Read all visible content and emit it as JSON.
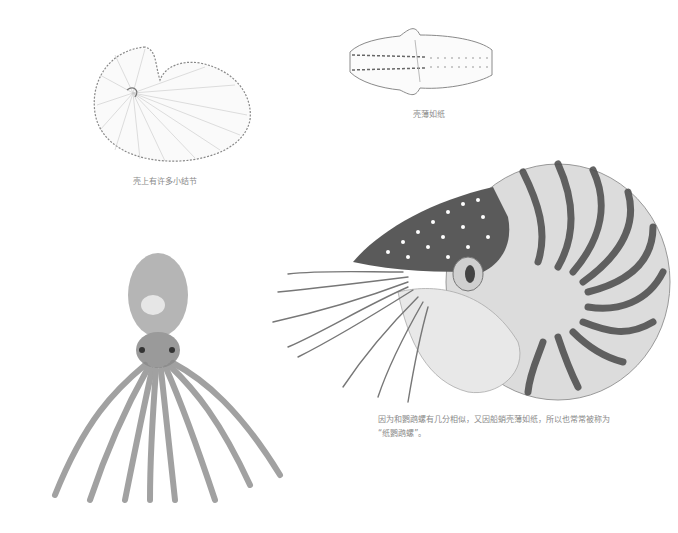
{
  "page": {
    "background": "#ffffff",
    "caption_color": "#8a8a8a"
  },
  "figures": [
    {
      "id": "paper-nautilus-shell",
      "caption": "壳上有许多小结节"
    },
    {
      "id": "paper-nautilus-shell-top",
      "caption": "壳薄如纸"
    },
    {
      "id": "chambered-nautilus",
      "caption_line1": "因为和鹦鹉螺有几分相似，又因船蛸壳薄如纸，所以也常常被称为",
      "caption_line2": "“纸鹦鹉螺”。"
    },
    {
      "id": "octopus",
      "caption": ""
    }
  ]
}
